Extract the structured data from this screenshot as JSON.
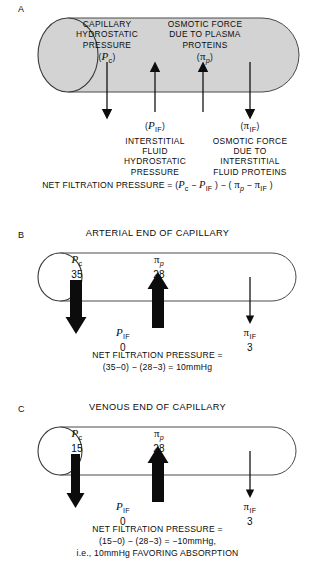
{
  "figure": {
    "type": "diagram",
    "background_color": "#ffffff",
    "ink_color": "#0c0c0c",
    "capillary_fill_a": "#d3d3d3",
    "capillary_fill_bc": "#ffffff"
  },
  "panels": [
    {
      "letter": "A",
      "title": "",
      "capillary_label_left": "CAPILLARY\nHYDROSTATIC\nPRESSURE",
      "labels_inside": [
        {
          "name": "capillary-hydrostatic-pressure",
          "lines": [
            "CAPILLARY",
            "HYDROSTATIC",
            "PRESSURE"
          ],
          "symbol_open": "(",
          "symbol_base": "P",
          "symbol_sub": "c",
          "symbol_close": ")"
        },
        {
          "name": "plasma-osmotic-force",
          "lines": [
            "OSMOTIC FORCE",
            "DUE TO PLASMA",
            "PROTEINS"
          ],
          "symbol_open": "(",
          "symbol_base": "π",
          "symbol_sub": "p",
          "symbol_close": ")"
        }
      ],
      "labels_below": [
        {
          "name": "interstitial-fluid-hydrostatic-pressure",
          "symbol_open": "(",
          "symbol_base": "P",
          "symbol_sub": "IF",
          "symbol_close": ")",
          "lines": [
            "INTERSTITIAL",
            "FLUID",
            "HYDROSTATIC",
            "PRESSURE"
          ]
        },
        {
          "name": "interstitial-fluid-osmotic-force",
          "symbol_open": "(",
          "symbol_base": "π",
          "symbol_sub": "IF",
          "symbol_close": ")",
          "lines": [
            "OSMOTIC FORCE",
            "DUE TO",
            "INTERSTITIAL",
            "FLUID PROTEINS"
          ]
        }
      ],
      "equation": {
        "name": "net-filtration-pressure-equation",
        "prefix": "NET FILTRATION PRESSURE = (",
        "term1_base": "P",
        "term1_sub": "c",
        "minus1": " − ",
        "term2_base": "P",
        "term2_sub": "IF",
        "middle": " ) − ( ",
        "term3_base": "π",
        "term3_sub": "p",
        "minus2": " − ",
        "term4_base": "π",
        "term4_sub": "IF",
        "suffix": " )"
      },
      "arrows": [
        {
          "name": "arrow-pc",
          "direction": "down",
          "weight": "thin"
        },
        {
          "name": "arrow-pif",
          "direction": "up",
          "weight": "thin"
        },
        {
          "name": "arrow-pi-p",
          "direction": "up",
          "weight": "thin"
        },
        {
          "name": "arrow-pi-if",
          "direction": "down",
          "weight": "thin"
        }
      ]
    },
    {
      "letter": "B",
      "title": "ARTERIAL END OF CAPILLARY",
      "forces": [
        {
          "name": "pc",
          "base": "P",
          "sub": "c",
          "value": "35",
          "direction": "down",
          "weight": "thick"
        },
        {
          "name": "pi-p",
          "base": "π",
          "sub": "p",
          "value": "28",
          "direction": "up",
          "weight": "thick"
        },
        {
          "name": "pif",
          "base": "P",
          "sub": "IF",
          "value": "0",
          "direction": "none",
          "weight": "none"
        },
        {
          "name": "pi-if",
          "base": "π",
          "sub": "IF",
          "value": "3",
          "direction": "down",
          "weight": "thin"
        }
      ],
      "result_lines": [
        "NET FILTRATION PRESSURE =",
        "(35−0) − (28−3) = 10mmHg"
      ]
    },
    {
      "letter": "C",
      "title": "VENOUS END OF CAPILLARY",
      "forces": [
        {
          "name": "pc",
          "base": "P",
          "sub": "c",
          "value": "15",
          "direction": "down",
          "weight": "thick"
        },
        {
          "name": "pi-p",
          "base": "π",
          "sub": "p",
          "value": "28",
          "direction": "up",
          "weight": "thick"
        },
        {
          "name": "pif",
          "base": "P",
          "sub": "IF",
          "value": "0",
          "direction": "none",
          "weight": "none"
        },
        {
          "name": "pi-if",
          "base": "π",
          "sub": "IF",
          "value": "3",
          "direction": "down",
          "weight": "thin"
        }
      ],
      "result_lines": [
        "NET FILTRATION PRESSURE =",
        "(15−0) − (28−3) = −10mmHg,",
        "i.e., 10mmHg FAVORING ABSORPTION"
      ]
    }
  ]
}
